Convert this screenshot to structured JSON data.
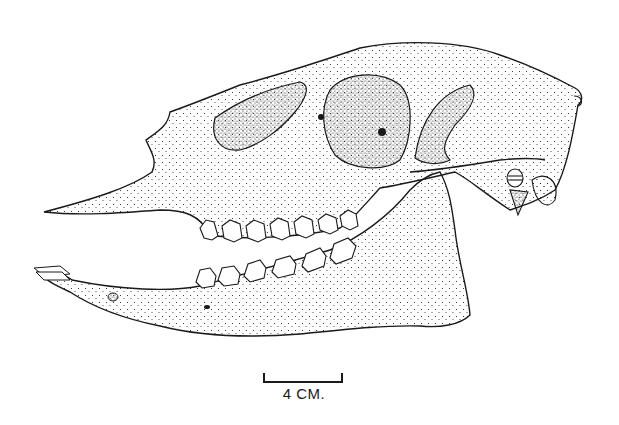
{
  "figure": {
    "style": "stipple-ink-drawing",
    "ink_color": "#1a1a1a",
    "background_color": "#ffffff"
  },
  "scale_bar": {
    "label": "4 CM."
  }
}
